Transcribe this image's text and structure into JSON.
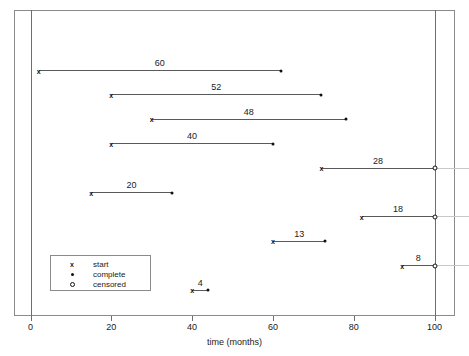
{
  "chart_data": {
    "type": "bar",
    "title": "",
    "xlabel": "time (months)",
    "ylabel": "",
    "xlim": [
      0,
      100
    ],
    "xticks": [
      0,
      20,
      40,
      60,
      80,
      100
    ],
    "xticklabels": [
      "0",
      "20",
      "40",
      "60",
      "80",
      "100"
    ],
    "grid": false,
    "legend_position": "lower-left",
    "legend": [
      {
        "symbol": "x",
        "label": "start"
      },
      {
        "symbol": "dot",
        "label": "complete"
      },
      {
        "symbol": "circle",
        "label": "censored"
      }
    ],
    "series_note": "Each horizontal segment is one subject: start time to end time; label shows duration in months.",
    "bars": [
      {
        "label": "60",
        "start": 2,
        "end": 62,
        "duration": 60,
        "end_type": "complete",
        "row": 0
      },
      {
        "label": "52",
        "start": 20,
        "end": 72,
        "duration": 52,
        "end_type": "complete",
        "row": 1
      },
      {
        "label": "48",
        "start": 30,
        "end": 78,
        "duration": 48,
        "end_type": "complete",
        "row": 2
      },
      {
        "label": "40",
        "start": 20,
        "end": 60,
        "duration": 40,
        "end_type": "complete",
        "row": 3
      },
      {
        "label": "28",
        "start": 72,
        "end": 100,
        "duration": 28,
        "end_type": "censored",
        "row": 4
      },
      {
        "label": "20",
        "start": 15,
        "end": 35,
        "duration": 20,
        "end_type": "complete",
        "row": 5
      },
      {
        "label": "18",
        "start": 82,
        "end": 100,
        "duration": 18,
        "end_type": "censored",
        "row": 6
      },
      {
        "label": "13",
        "start": 60,
        "end": 73,
        "duration": 13,
        "end_type": "complete",
        "row": 7
      },
      {
        "label": "8",
        "start": 92,
        "end": 100,
        "duration": 8,
        "end_type": "censored",
        "row": 8
      },
      {
        "label": "4",
        "start": 40,
        "end": 44,
        "duration": 4,
        "end_type": "complete",
        "row": 9
      }
    ]
  },
  "axis": {
    "x_title": "time (months)"
  },
  "markers": {
    "start_glyph": "x"
  }
}
